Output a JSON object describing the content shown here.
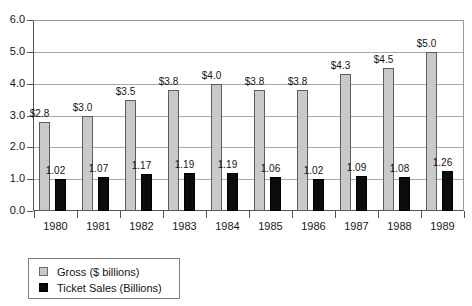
{
  "chart_data": {
    "type": "bar",
    "title": "",
    "subtitle": "",
    "xlabel": "",
    "ylabel": "",
    "ylim": [
      0,
      6
    ],
    "ytick_labels": [
      "0.0",
      "1.0",
      "2.0",
      "3.0",
      "4.0",
      "5.0",
      "6.0"
    ],
    "ytick_values": [
      0,
      1,
      2,
      3,
      4,
      5,
      6
    ],
    "grid": true,
    "legend_position": "below-left",
    "categories": [
      "1980",
      "1981",
      "1982",
      "1983",
      "1984",
      "1985",
      "1986",
      "1987",
      "1988",
      "1989"
    ],
    "series": [
      {
        "name": "Gross ($ billions)",
        "color": "#c9c9c9",
        "values": [
          2.8,
          3.0,
          3.5,
          3.8,
          4.0,
          3.8,
          3.8,
          4.3,
          4.5,
          5.0
        ],
        "labels": [
          "$2.8",
          "$3.0",
          "$3.5",
          "$3.8",
          "$4.0",
          "$3.8",
          "$3.8",
          "$4.3",
          "$4.5",
          "$5.0"
        ]
      },
      {
        "name": "Ticket Sales (Billions)",
        "color": "#0c0c0c",
        "values": [
          1.02,
          1.07,
          1.17,
          1.19,
          1.19,
          1.06,
          1.02,
          1.09,
          1.08,
          1.26
        ],
        "labels": [
          "1.02",
          "1.07",
          "1.17",
          "1.19",
          "1.19",
          "1.06",
          "1.02",
          "1.09",
          "1.08",
          "1.26"
        ]
      }
    ]
  },
  "legend": {
    "items": [
      {
        "label": "Gross ($ billions)",
        "swatch": "gross"
      },
      {
        "label": "Ticket Sales (Billions)",
        "swatch": "tickets"
      }
    ]
  }
}
